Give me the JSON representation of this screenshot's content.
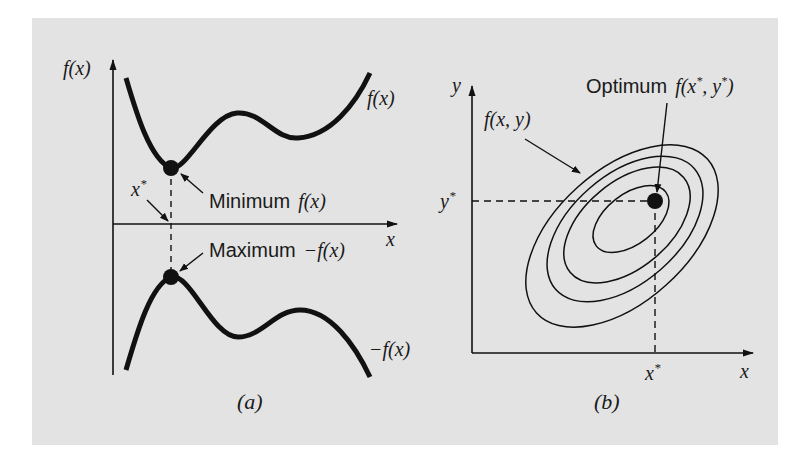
{
  "figure": {
    "background_color": "#e3e3e3",
    "ink_color": "#111111",
    "panel_a": {
      "caption": "(a)",
      "y_axis_label": "f(x)",
      "x_axis_label": "x",
      "curve_top_label": "f(x)",
      "curve_bottom_label": "−f(x)",
      "x_star_label": "x",
      "x_star_superscript": "*",
      "minimum_annotation": {
        "word": "Minimum",
        "expr": "f(x)"
      },
      "maximum_annotation": {
        "word": "Maximum",
        "expr": "−f(x)"
      }
    },
    "panel_b": {
      "caption": "(b)",
      "y_axis_label": "y",
      "x_axis_label": "x",
      "y_star_label": "y",
      "x_star_label": "x",
      "star_superscript": "*",
      "contour_label": "f(x, y)",
      "contour_count": 4,
      "optimum_annotation": {
        "word": "Optimum",
        "expr_prefix": "f(x",
        "expr_mid": ", y",
        "expr_suffix": ")",
        "superscript": "*"
      }
    }
  }
}
